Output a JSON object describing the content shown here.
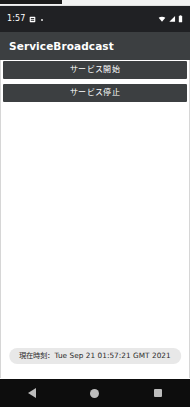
{
  "status_bar": {
    "time": "1:57",
    "left_icons": [
      "sim-card-icon",
      "dot-icon"
    ],
    "right_icons": [
      "wifi-icon",
      "cellular-signal-icon",
      "battery-icon"
    ],
    "background_color": "#202124",
    "text_color": "#ffffff"
  },
  "app_bar": {
    "title": "ServiceBroadcast",
    "background_color": "#3c3f41",
    "text_color": "#ffffff"
  },
  "main": {
    "background_color": "#ffffff",
    "buttons": [
      {
        "label": "サービス開始",
        "name": "start-service-button"
      },
      {
        "label": "サービス停止",
        "name": "stop-service-button"
      }
    ]
  },
  "toast": {
    "message": "現在時刻：Tue Sep 21 01:57:21 GMT 2021",
    "background_color": "#e8e8e8",
    "text_color": "#2b2b2b"
  },
  "nav_bar": {
    "background_color": "#0d0d0d",
    "items": [
      {
        "name": "nav-back-button",
        "icon": "triangle-back-icon"
      },
      {
        "name": "nav-home-button",
        "icon": "circle-home-icon"
      },
      {
        "name": "nav-recents-button",
        "icon": "square-recents-icon"
      }
    ]
  }
}
